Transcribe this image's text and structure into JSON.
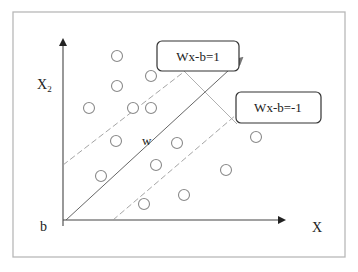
{
  "diagram": {
    "axes": {
      "y_label": "X",
      "y_label_subscript": "2",
      "x_label": "X",
      "origin_label": "b"
    },
    "vector_label": "w",
    "boundaries": [
      {
        "name": "positive-margin",
        "label": "Wx-b=1"
      },
      {
        "name": "negative-margin",
        "label": "Wx-b=-1"
      }
    ],
    "points": [
      {
        "x": 117,
        "y": 56
      },
      {
        "x": 151,
        "y": 76
      },
      {
        "x": 117,
        "y": 86
      },
      {
        "x": 89,
        "y": 108
      },
      {
        "x": 133,
        "y": 108
      },
      {
        "x": 151,
        "y": 108
      },
      {
        "x": 116,
        "y": 141
      },
      {
        "x": 177,
        "y": 143
      },
      {
        "x": 256,
        "y": 137
      },
      {
        "x": 101,
        "y": 176
      },
      {
        "x": 156,
        "y": 165
      },
      {
        "x": 226,
        "y": 170
      },
      {
        "x": 184,
        "y": 195
      },
      {
        "x": 144,
        "y": 204
      }
    ],
    "colors": {
      "frame": "#b8b8b8",
      "axis": "#444444",
      "point_stroke": "#8a8a8a",
      "dashed_line": "#9a9a9a",
      "box_stroke": "#333333"
    }
  }
}
